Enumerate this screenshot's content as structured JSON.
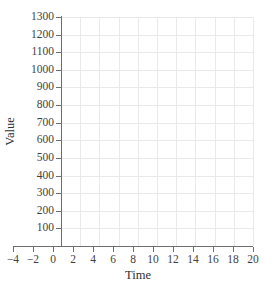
{
  "chart_data": {
    "type": "line",
    "title": "",
    "xlabel": "Time",
    "ylabel": "Value",
    "xlim": [
      -4,
      20
    ],
    "ylim": [
      0,
      1300
    ],
    "grid": true,
    "legend": null,
    "series": [],
    "x_ticks": [
      "−4",
      "−2",
      "0",
      "2",
      "4",
      "6",
      "8",
      "10",
      "12",
      "14",
      "16",
      "18",
      "20"
    ],
    "x_tick_values": [
      -4,
      -2,
      0,
      2,
      4,
      6,
      8,
      10,
      12,
      14,
      16,
      18,
      20
    ],
    "y_ticks": [
      "1300",
      "1200",
      "1100",
      "1000",
      "900",
      "800",
      "700",
      "600",
      "500",
      "400",
      "300",
      "200",
      "100"
    ],
    "y_tick_values": [
      1300,
      1200,
      1100,
      1000,
      900,
      800,
      700,
      600,
      500,
      400,
      300,
      200,
      100
    ],
    "grid_x_values": [
      0,
      2,
      4,
      6,
      8,
      10,
      12,
      14,
      16,
      18,
      20
    ],
    "grid_y_values": [
      100,
      200,
      300,
      400,
      500,
      600,
      700,
      800,
      900,
      1000,
      1100,
      1200,
      1300
    ],
    "colors": {
      "background": "#ffffff",
      "grid": "#e9e9e9",
      "axis": "#6e6e6e",
      "text": "#3f3f3f"
    },
    "note": "empty plotting grid; no data plotted"
  }
}
